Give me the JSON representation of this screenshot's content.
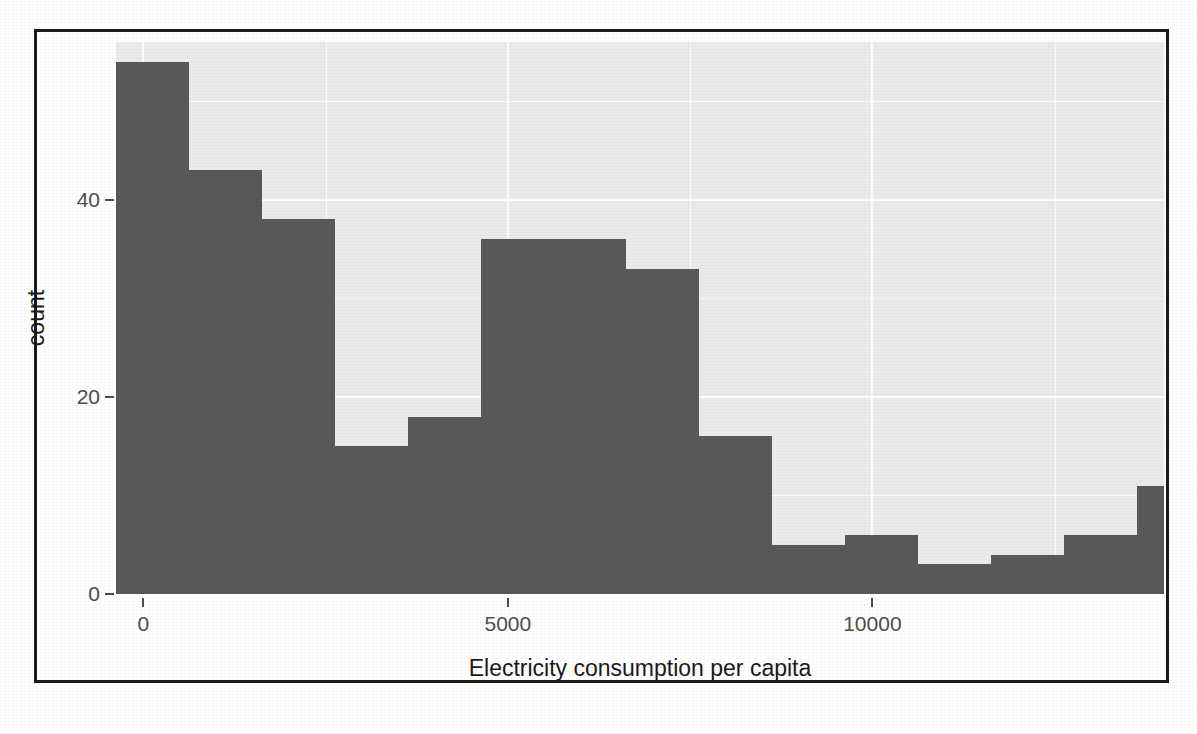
{
  "chart_data": {
    "type": "bar",
    "subtype": "histogram",
    "title": "",
    "xlabel": "Electricity consumption per capita",
    "ylabel": "count",
    "xlim": [
      -375,
      14000
    ],
    "ylim": [
      0,
      56
    ],
    "grid": true,
    "legend": "none",
    "bar_color": "#595959",
    "panel_color": "#ebebeb",
    "gridline_color": "#ffffff",
    "bin_width": 1000,
    "x_ticks": [
      {
        "value": 0,
        "label": "0"
      },
      {
        "value": 5000,
        "label": "5000"
      },
      {
        "value": 10000,
        "label": "10000"
      }
    ],
    "y_ticks": [
      {
        "value": 0,
        "label": "0"
      },
      {
        "value": 20,
        "label": "20"
      },
      {
        "value": 40,
        "label": "40"
      }
    ],
    "bins": [
      {
        "x0": -375,
        "x1": 625,
        "count": 54
      },
      {
        "x0": 625,
        "x1": 1625,
        "count": 43
      },
      {
        "x0": 1625,
        "x1": 2625,
        "count": 38
      },
      {
        "x0": 2625,
        "x1": 3625,
        "count": 15
      },
      {
        "x0": 3625,
        "x1": 4625,
        "count": 18
      },
      {
        "x0": 4625,
        "x1": 5625,
        "count": 36
      },
      {
        "x0": 5625,
        "x1": 6625,
        "count": 36
      },
      {
        "x0": 6625,
        "x1": 7625,
        "count": 33
      },
      {
        "x0": 7625,
        "x1": 8625,
        "count": 16
      },
      {
        "x0": 8625,
        "x1": 9625,
        "count": 5
      },
      {
        "x0": 9625,
        "x1": 10625,
        "count": 6
      },
      {
        "x0": 10625,
        "x1": 11625,
        "count": 3
      },
      {
        "x0": 11625,
        "x1": 12625,
        "count": 4
      },
      {
        "x0": 12625,
        "x1": 13625,
        "count": 6
      },
      {
        "x0": 13625,
        "x1": 14000,
        "count": 11
      }
    ],
    "categories": [
      "-375",
      "625",
      "1625",
      "2625",
      "3625",
      "4625",
      "5625",
      "6625",
      "7625",
      "8625",
      "9625",
      "10625",
      "11625",
      "12625",
      "13625"
    ],
    "values": [
      54,
      43,
      38,
      15,
      18,
      36,
      36,
      33,
      16,
      5,
      6,
      3,
      4,
      6,
      11
    ]
  },
  "axis": {
    "x_title": "Electricity consumption per capita",
    "y_title": "count"
  }
}
